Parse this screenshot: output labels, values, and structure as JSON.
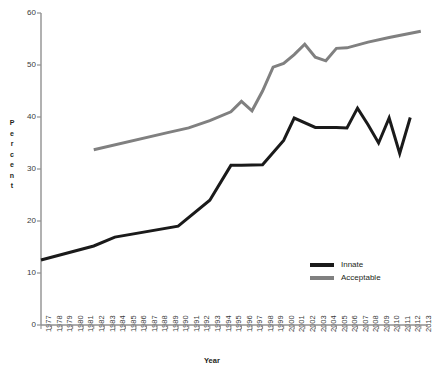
{
  "chart_data": {
    "type": "line",
    "title": "",
    "xlabel": "Year",
    "ylabel": "Percent",
    "ylim": [
      0,
      60
    ],
    "yticks": [
      0,
      10,
      20,
      30,
      40,
      50,
      60
    ],
    "grid": false,
    "legend_position": "inside-right",
    "x": [
      1977,
      1978,
      1979,
      1980,
      1981,
      1982,
      1983,
      1984,
      1985,
      1986,
      1987,
      1988,
      1989,
      1990,
      1991,
      1992,
      1993,
      1994,
      1995,
      1996,
      1997,
      1998,
      1999,
      2000,
      2001,
      2002,
      2003,
      2004,
      2005,
      2006,
      2007,
      2008,
      2009,
      2010,
      2011,
      2012,
      2013
    ],
    "xticklabels": [
      "1977",
      "1978",
      "1979",
      "1980",
      "1981",
      "1982",
      "1983",
      "1984",
      "1985",
      "1986",
      "1987",
      "1988",
      "1989",
      "1990",
      "1991",
      "1992",
      "1993",
      "1994",
      "1995",
      "1996",
      "1997",
      "1998",
      "1999",
      "2000",
      "2001",
      "2002",
      "2003",
      "2004",
      "2005",
      "2006",
      "2007",
      "2008",
      "2009",
      "2010",
      "2011",
      "2012",
      "2013"
    ],
    "series": [
      {
        "name": "Innate",
        "color": "#1a1a1a",
        "x": [
          1977,
          1982,
          1984,
          1990,
          1993,
          1995,
          1996,
          1998,
          2000,
          2001,
          2003,
          2005,
          2006,
          2007,
          2008,
          2009,
          2010,
          2011,
          2012
        ],
        "values": [
          12.5,
          15.2,
          16.9,
          19.0,
          24.0,
          30.7,
          30.7,
          30.8,
          35.5,
          39.8,
          38.0,
          38.0,
          37.9,
          41.7,
          38.5,
          35.0,
          39.8,
          33.0,
          39.9
        ]
      },
      {
        "name": "Acceptable",
        "color": "#808080",
        "x": [
          1982,
          1989,
          1991,
          1993,
          1995,
          1996,
          1997,
          1998,
          1999,
          2000,
          2001,
          2002,
          2003,
          2004,
          2005,
          2006,
          2008,
          2010,
          2013
        ],
        "values": [
          33.7,
          37.0,
          37.9,
          39.3,
          41.0,
          43.0,
          41.2,
          45.0,
          49.6,
          50.3,
          52.0,
          54.0,
          51.5,
          50.8,
          53.2,
          53.3,
          54.4,
          55.3,
          56.5
        ]
      }
    ]
  },
  "axes": {
    "y_label_letters": [
      "P",
      "e",
      "r",
      "c",
      "e",
      "n",
      "t"
    ],
    "y_tick_labels": [
      "60",
      "50",
      "40",
      "30",
      "20",
      "10",
      "0"
    ],
    "x_axis_title": "Year"
  },
  "legend": {
    "items": [
      {
        "label": "Innate",
        "color": "#1a1a1a"
      },
      {
        "label": "Acceptable",
        "color": "#808080"
      }
    ]
  }
}
